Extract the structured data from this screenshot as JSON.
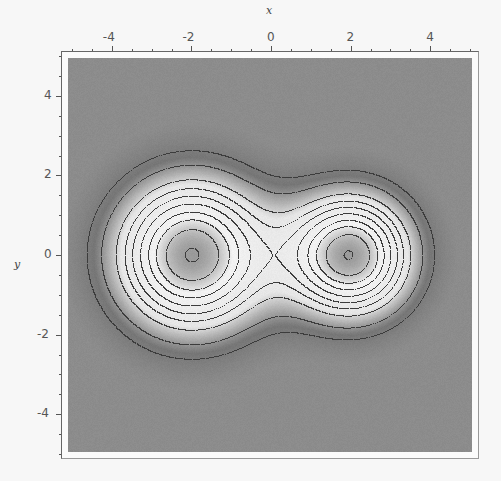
{
  "chart_data": {
    "type": "heatmap",
    "subtype": "contour-density",
    "title": "",
    "xlabel": "x",
    "ylabel": "y",
    "x_ticks": [
      -4,
      -2,
      0,
      2,
      4
    ],
    "y_ticks": [
      4,
      2,
      0,
      -2,
      -4
    ],
    "xlim": [
      -5.2,
      5.2
    ],
    "ylim": [
      -5.0,
      5.0
    ],
    "grid": false,
    "legend": "none",
    "colormap": "grayscale",
    "peaks": [
      {
        "name": "left",
        "center": [
          -2.0,
          0.0
        ],
        "width": 2.0,
        "amplitude": 1.0
      },
      {
        "name": "right",
        "center": [
          2.0,
          0.0
        ],
        "width": 1.62,
        "amplitude": 0.98
      }
    ],
    "contour_levels": [
      0.18,
      0.28,
      0.41,
      0.5,
      0.58,
      0.665,
      0.75,
      0.825,
      0.905,
      0.995
    ],
    "colors": {
      "background_gray": "#8c8c8c",
      "dark_band": "#767676",
      "light_band": "#f2f2f2",
      "center_gray": "#9a9a9a",
      "contour_line": "#3c3c3c"
    }
  },
  "labels": {
    "x_axis": "x",
    "y_axis": "y"
  }
}
